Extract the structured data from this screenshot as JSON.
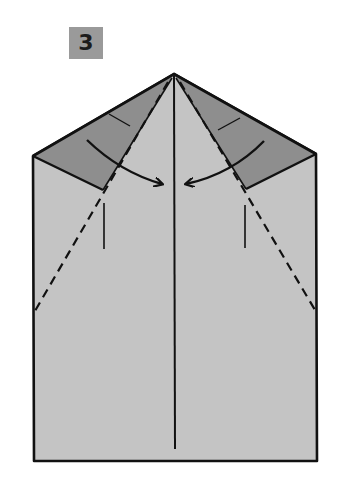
{
  "step": {
    "number": "3"
  },
  "diagram": {
    "colors": {
      "paper": "#c4c4c4",
      "flap": "#8e8e8e",
      "outline": "#111111",
      "badge": "#9a9a9a"
    },
    "points": {
      "apex": [
        174,
        74
      ],
      "top_left": [
        33,
        156
      ],
      "top_right": [
        316,
        154
      ],
      "bottom_left": [
        34,
        461
      ],
      "bottom_right": [
        317,
        461
      ],
      "left_flap_inner": [
        103,
        190
      ],
      "right_flap_inner": [
        246,
        189
      ]
    },
    "lines": {
      "center_crease": {
        "from": [
          174,
          76
        ],
        "to": [
          175,
          449
        ]
      },
      "left_valley_fold": {
        "from": [
          168,
          82
        ],
        "to": [
          35,
          311
        ]
      },
      "right_valley_fold": {
        "from": [
          180,
          82
        ],
        "to": [
          315,
          310
        ]
      },
      "left_tick": {
        "from": [
          104,
          203
        ],
        "to": [
          104,
          249
        ]
      },
      "right_tick": {
        "from": [
          245,
          205
        ],
        "to": [
          245,
          248
        ]
      }
    },
    "arrows": [
      {
        "name": "left-fold-arrow",
        "from": [
          87,
          140
        ],
        "to": [
          162,
          184
        ],
        "direction": "inward"
      },
      {
        "name": "right-fold-arrow",
        "from": [
          264,
          141
        ],
        "to": [
          186,
          184
        ],
        "direction": "inward"
      }
    ]
  }
}
